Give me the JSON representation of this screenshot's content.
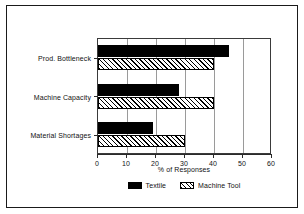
{
  "chart_data": {
    "type": "bar",
    "orientation": "horizontal",
    "title": "",
    "xlabel": "% of Responses",
    "ylabel": "",
    "categories": [
      "Prod. Bottleneck",
      "Machine Capacity",
      "Material Shortages"
    ],
    "series": [
      {
        "name": "Textile",
        "values": [
          45,
          28,
          19
        ],
        "fill": "solid",
        "color": "#000000"
      },
      {
        "name": "Machine Tool",
        "values": [
          40,
          40,
          30
        ],
        "fill": "hatched",
        "color": "#000000"
      }
    ],
    "xlim": [
      0,
      60
    ],
    "xticks": [
      0,
      10,
      20,
      30,
      40,
      50,
      60
    ],
    "xticklabels": [
      "0",
      "10",
      "20",
      "30",
      "40",
      "50",
      "60"
    ],
    "grid": true,
    "grid_axis": "x",
    "legend_position": "bottom-center",
    "frame": true
  }
}
